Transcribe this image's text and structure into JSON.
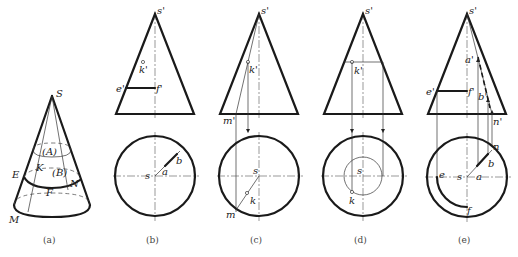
{
  "figure": {
    "captions": [
      "(a)",
      "(b)",
      "(c)",
      "(d)",
      "(e)"
    ],
    "panel_a": {
      "labels": {
        "apex": "S",
        "regionA": "(A)",
        "regionB": "(B)",
        "K": "K",
        "E": "E",
        "F": "F",
        "N": "N",
        "M": "M"
      }
    },
    "panel_b": {
      "labels": {
        "s_prime": "s'",
        "k_prime": "k'",
        "e_prime": "e'",
        "f_prime": "f'",
        "s": "s",
        "a": "a",
        "b": "b"
      }
    },
    "panel_c": {
      "labels": {
        "s_prime": "s'",
        "k_prime": "k'",
        "m_prime": "m'",
        "s": "s",
        "k": "k",
        "m": "m"
      }
    },
    "panel_d": {
      "labels": {
        "s_prime": "s'",
        "k_prime": "k'",
        "s": "s",
        "k": "k"
      }
    },
    "panel_e": {
      "labels": {
        "s_prime": "s'",
        "a_prime": "a'",
        "b_prime": "b'",
        "e_prime": "e'",
        "f_prime": "f'",
        "n_prime": "n'",
        "s": "s",
        "a": "a",
        "b": "b",
        "n": "n",
        "e": "e",
        "f": "f"
      }
    },
    "colors": {
      "line": "#1a1a1a",
      "background": "#ffffff"
    }
  }
}
